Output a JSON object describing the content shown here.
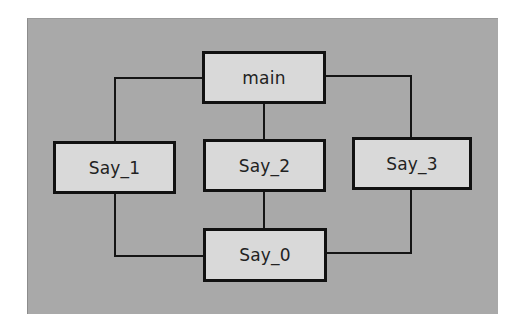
{
  "diagram": {
    "nodes": [
      {
        "id": "main",
        "label": "main",
        "x": 202,
        "y": 51,
        "w": 124,
        "h": 53
      },
      {
        "id": "say1",
        "label": "Say_1",
        "x": 53,
        "y": 141,
        "w": 123,
        "h": 53
      },
      {
        "id": "say2",
        "label": "Say_2",
        "x": 203,
        "y": 139,
        "w": 123,
        "h": 53
      },
      {
        "id": "say3",
        "label": "Say_3",
        "x": 352,
        "y": 137,
        "w": 120,
        "h": 53
      },
      {
        "id": "say0",
        "label": "Say_0",
        "x": 203,
        "y": 228,
        "w": 124,
        "h": 54
      }
    ],
    "edges": [
      {
        "from": "main",
        "to": "say1"
      },
      {
        "from": "main",
        "to": "say2"
      },
      {
        "from": "main",
        "to": "say3"
      },
      {
        "from": "say1",
        "to": "say0"
      },
      {
        "from": "say2",
        "to": "say0"
      },
      {
        "from": "say3",
        "to": "say0"
      }
    ],
    "colors": {
      "background": "#a9a9a9",
      "node_fill": "#d9d9d9",
      "stroke": "#111111"
    }
  }
}
